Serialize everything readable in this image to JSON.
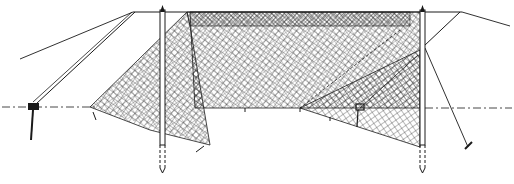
{
  "figure": {
    "colors": {
      "ink": "#1a1a1a",
      "background": "#ffffff"
    },
    "elements": [
      "top-rope",
      "left-pole",
      "right-pole",
      "left-guy-rope",
      "right-guy-rope",
      "net-main-panel",
      "net-left-wing",
      "net-right-wing",
      "ground-line",
      "left-anchor-stake",
      "right-anchor-stake"
    ]
  }
}
